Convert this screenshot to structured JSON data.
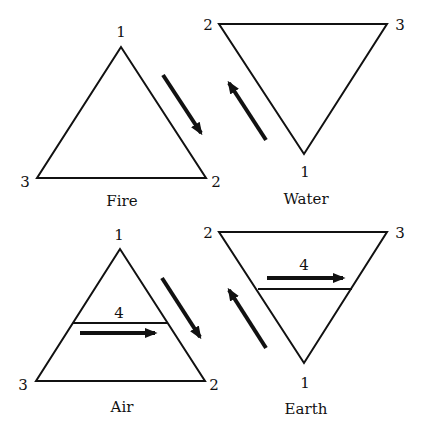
{
  "diagram": {
    "colors": {
      "stroke": "#111111",
      "background": "#ffffff"
    },
    "panels": [
      {
        "name": "Fire",
        "orientation": "up",
        "vertex_labels": {
          "top": "1",
          "bottom_left": "3",
          "bottom_right": "2"
        },
        "side_arrow": "down-right"
      },
      {
        "name": "Water",
        "orientation": "down",
        "vertex_labels": {
          "top_left": "2",
          "top_right": "3",
          "bottom": "1"
        },
        "side_arrow": "up-left"
      },
      {
        "name": "Air",
        "orientation": "up",
        "vertex_labels": {
          "top": "1",
          "bottom_left": "3",
          "bottom_right": "2"
        },
        "divider_label": "4",
        "side_arrow": "down-right",
        "inner_arrow": "right"
      },
      {
        "name": "Earth",
        "orientation": "down",
        "vertex_labels": {
          "top_left": "2",
          "top_right": "3",
          "bottom": "1"
        },
        "divider_label": "4",
        "side_arrow": "up-left",
        "inner_arrow": "right"
      }
    ]
  }
}
